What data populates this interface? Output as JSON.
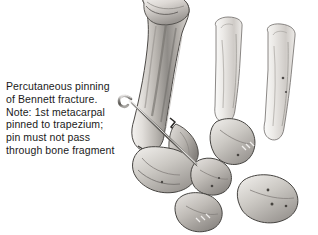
{
  "figure": {
    "title": "Percutaneous pinning of Bennett fracture",
    "width": 318,
    "height": 235,
    "background_color": "#ffffff"
  },
  "caption": {
    "text": "Percutaneous pinning\nof Bennett fracture.\nNote: 1st metacarpal\npinned to trapezium;\npin must not pass\nthrough bone fragment",
    "lines": [
      "Percutaneous pinning",
      "of Bennett fracture.",
      "Note: 1st metacarpal",
      "pinned to trapezium;",
      "pin must not pass",
      "through bone fragment"
    ],
    "color": "#1a1a1a"
  },
  "illustration": {
    "subject": "hand skeleton, thumb base with Bennett fracture fixed by percutaneous K-wire",
    "style": "grayscale medical line-and-wash drawing",
    "palette": {
      "bone_light": "#f2f0ee",
      "bone_mid": "#c9c6c2",
      "bone_shadow": "#8e8b87",
      "bone_dark": "#5d5a57",
      "outline": "#3a3836",
      "pin_metal": "#6f6d6a",
      "pin_highlight": "#e8e7e5",
      "fracture_line": "#2b2927"
    },
    "parts": [
      {
        "name": "first-metacarpal",
        "label": "1st metacarpal"
      },
      {
        "name": "bennett-fracture-fragment",
        "label": "Bennett fracture fragment"
      },
      {
        "name": "fracture-line",
        "label": "fracture line"
      },
      {
        "name": "trapezium",
        "label": "trapezium"
      },
      {
        "name": "scaphoid",
        "label": "scaphoid"
      },
      {
        "name": "trapezoid",
        "label": "trapezoid"
      },
      {
        "name": "capitate",
        "label": "capitate"
      },
      {
        "name": "second-metacarpal",
        "label": "2nd metacarpal"
      },
      {
        "name": "third-metacarpal",
        "label": "3rd metacarpal"
      },
      {
        "name": "kirschner-pin",
        "label": "percutaneous pin"
      }
    ]
  }
}
